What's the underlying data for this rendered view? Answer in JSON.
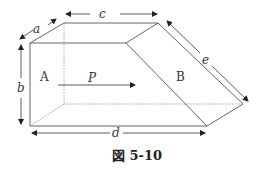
{
  "figure": {
    "caption": "図 5-10",
    "regions": {
      "A": "A",
      "B": "B"
    },
    "flow_label": "P",
    "dimensions": {
      "a": "a",
      "b": "b",
      "c": "c",
      "d": "d",
      "e": "e"
    },
    "colors": {
      "line": "#555555",
      "dotted": "#777777",
      "text": "#333333"
    }
  }
}
